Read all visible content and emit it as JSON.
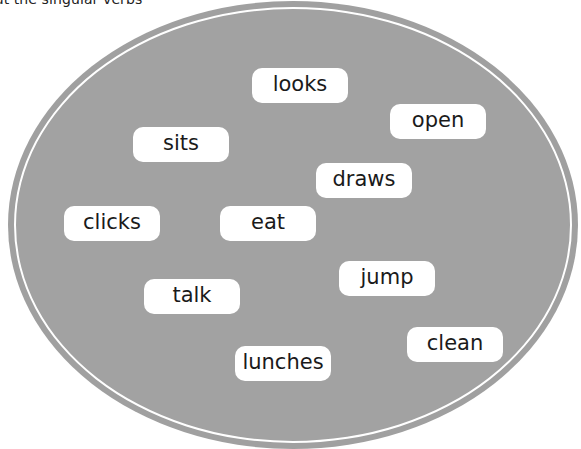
{
  "instruction": "out the singular verbs",
  "colors": {
    "ellipse_fill": "#a0a0a0",
    "ring": "#ffffff",
    "word_box": "#ffffff",
    "word_text": "#1a1a1a"
  },
  "words": [
    {
      "label": "looks",
      "x": 252,
      "y": 68
    },
    {
      "label": "open",
      "x": 390,
      "y": 104
    },
    {
      "label": "sits",
      "x": 133,
      "y": 127
    },
    {
      "label": "draws",
      "x": 316,
      "y": 163
    },
    {
      "label": "clicks",
      "x": 64,
      "y": 206
    },
    {
      "label": "eat",
      "x": 220,
      "y": 206
    },
    {
      "label": "jump",
      "x": 339,
      "y": 261
    },
    {
      "label": "talk",
      "x": 144,
      "y": 279
    },
    {
      "label": "clean",
      "x": 407,
      "y": 327
    },
    {
      "label": "lunches",
      "x": 235,
      "y": 346
    }
  ]
}
